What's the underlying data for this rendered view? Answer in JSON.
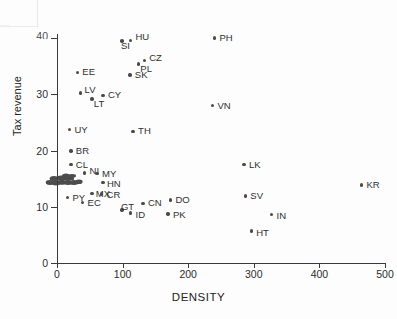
{
  "chart_data": {
    "type": "scatter",
    "title": "",
    "xlabel": "DENSITY",
    "ylabel": "Tax revenue",
    "xlim": [
      0,
      500
    ],
    "ylim": [
      0,
      40
    ],
    "xticks": [
      0,
      100,
      200,
      300,
      400,
      500
    ],
    "yticks": [
      0,
      10,
      20,
      30,
      40
    ],
    "grid": false,
    "legend": "none",
    "top_y_tick_clipped": true,
    "points": [
      {
        "label": "PH",
        "x": 240,
        "y": 40.0
      },
      {
        "label": "HU",
        "x": 112,
        "y": 39.6
      },
      {
        "label": "SI",
        "x": 99,
        "y": 39.5
      },
      {
        "label": "CZ",
        "x": 133,
        "y": 36.0
      },
      {
        "label": "PL",
        "x": 124,
        "y": 35.4
      },
      {
        "label": "EE",
        "x": 31,
        "y": 33.9
      },
      {
        "label": "SK",
        "x": 111,
        "y": 33.4
      },
      {
        "label": "LV",
        "x": 36,
        "y": 30.2
      },
      {
        "label": "CY",
        "x": 70,
        "y": 29.8
      },
      {
        "label": "LT",
        "x": 53,
        "y": 29.2
      },
      {
        "label": "VN",
        "x": 237,
        "y": 28.0
      },
      {
        "label": "UY",
        "x": 19,
        "y": 23.7
      },
      {
        "label": "TH",
        "x": 116,
        "y": 23.4
      },
      {
        "label": "BR",
        "x": 21,
        "y": 19.9
      },
      {
        "label": "LK",
        "x": 285,
        "y": 17.5
      },
      {
        "label": "CL",
        "x": 21,
        "y": 17.5
      },
      {
        "label": "NI",
        "x": 42,
        "y": 16.0
      },
      {
        "label": "MY",
        "x": 61,
        "y": 15.9
      },
      {
        "label": "KR",
        "x": 464,
        "y": 13.9
      },
      {
        "label": "HN",
        "x": 70,
        "y": 14.3
      },
      {
        "label": "SV",
        "x": 287,
        "y": 11.9
      },
      {
        "label": "PY",
        "x": 16,
        "y": 11.7
      },
      {
        "label": "MX",
        "x": 53,
        "y": 12.4
      },
      {
        "label": "CR",
        "x": 68,
        "y": 12.3
      },
      {
        "label": "DO",
        "x": 173,
        "y": 11.2
      },
      {
        "label": "EC",
        "x": 39,
        "y": 10.8
      },
      {
        "label": "CN",
        "x": 131,
        "y": 10.6
      },
      {
        "label": "IN",
        "x": 327,
        "y": 8.6
      },
      {
        "label": "GT",
        "x": 99,
        "y": 9.4
      },
      {
        "label": "ID",
        "x": 112,
        "y": 8.9
      },
      {
        "label": "PK",
        "x": 169,
        "y": 8.7
      },
      {
        "label": "HT",
        "x": 296,
        "y": 5.7
      }
    ],
    "overlapping_cluster_note": "dense pile of overlapping country labels near x 10-50, y 13-15 (illegible in scan)"
  },
  "style": {
    "point_color": "#4a4a4a",
    "axis_color": "#3a3a3a",
    "text_color": "#2c2c2c",
    "background": "#fdfdfd"
  }
}
